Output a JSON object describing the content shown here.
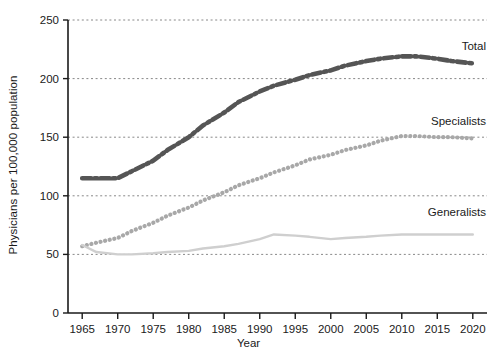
{
  "chart_data": {
    "type": "line",
    "title": "",
    "xlabel": "Year",
    "ylabel": "Physicians per 100,000 population",
    "xlim": [
      1963,
      2022
    ],
    "ylim": [
      0,
      250
    ],
    "yticks": [
      0,
      50,
      100,
      150,
      200,
      250
    ],
    "xticks": [
      1965,
      1970,
      1975,
      1980,
      1985,
      1990,
      1995,
      2000,
      2005,
      2010,
      2015,
      2020
    ],
    "grid": "horizontal-dashed",
    "legend_position": "inline-right-of-series",
    "x": [
      1965,
      1967,
      1970,
      1972,
      1975,
      1977,
      1980,
      1982,
      1985,
      1987,
      1990,
      1992,
      1995,
      1997,
      2000,
      2002,
      2005,
      2007,
      2010,
      2012,
      2015,
      2017,
      2020
    ],
    "series": [
      {
        "name": "Total",
        "label": "Total",
        "color": "#555555",
        "style": "dash-dot",
        "values": [
          115,
          115,
          115,
          121,
          130,
          139,
          150,
          160,
          171,
          180,
          189,
          194,
          199,
          203,
          207,
          211,
          215,
          217,
          219,
          219,
          217,
          215,
          213
        ]
      },
      {
        "name": "Specialists",
        "label": "Specialists",
        "color": "#a8a8a8",
        "style": "dotted",
        "values": [
          57,
          60,
          64,
          70,
          77,
          83,
          90,
          96,
          103,
          109,
          115,
          120,
          126,
          131,
          135,
          139,
          143,
          147,
          151,
          151,
          150,
          150,
          149
        ]
      },
      {
        "name": "Generalists",
        "label": "Generalists",
        "color": "#cfcfcf",
        "style": "solid",
        "values": [
          58,
          52,
          50,
          50,
          51,
          52,
          53,
          55,
          57,
          59,
          63,
          67,
          66,
          65,
          63,
          64,
          65,
          66,
          67,
          67,
          67,
          67,
          67
        ]
      }
    ]
  },
  "axis": {
    "y_tick_labels": [
      "0",
      "50",
      "100",
      "150",
      "200",
      "250"
    ],
    "x_tick_labels": [
      "1965",
      "1970",
      "1975",
      "1980",
      "1985",
      "1990",
      "1995",
      "2000",
      "2005",
      "2010",
      "2015",
      "2020"
    ],
    "x_title": "Year",
    "y_title": "Physicians per 100,000 population"
  },
  "annotations": {
    "total_label": "Total",
    "specialists_label": "Specialists",
    "generalists_label": "Generalists"
  }
}
